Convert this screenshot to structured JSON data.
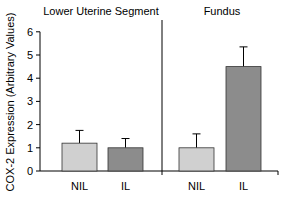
{
  "chart_data": {
    "type": "bar",
    "ylabel": "COX-2 Expression (Arbitrary Values)",
    "ylim": [
      0,
      6
    ],
    "yticks": [
      0,
      1,
      2,
      3,
      4,
      5,
      6
    ],
    "panels": [
      {
        "title": "Lower Uterine Segment",
        "categories": [
          "NIL",
          "IL"
        ],
        "values": [
          1.2,
          1.0
        ],
        "errors": [
          0.55,
          0.4
        ]
      },
      {
        "title": "Fundus",
        "categories": [
          "NIL",
          "IL"
        ],
        "values": [
          1.0,
          4.5
        ],
        "errors": [
          0.6,
          0.85
        ]
      }
    ],
    "colors": {
      "NIL": "#d0d0d0",
      "IL": "#8c8c8c"
    }
  }
}
